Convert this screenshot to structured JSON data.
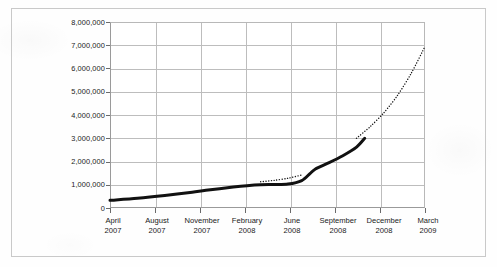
{
  "chart_data": {
    "type": "line",
    "title": "",
    "subtitle": "",
    "xlabel": "",
    "ylabel": "",
    "grid": true,
    "legend": "none",
    "xlim": [
      "April 2007",
      "March 2009"
    ],
    "ylim": [
      0,
      8000000
    ],
    "ytick_labels": [
      "8,000,000",
      "7,000,000",
      "6,000,000",
      "5,000,000",
      "4,000,000",
      "3,000,000",
      "2,000,000",
      "1,000,000",
      "0"
    ],
    "ytick_values": [
      8000000,
      7000000,
      6000000,
      5000000,
      4000000,
      3000000,
      2000000,
      1000000,
      0
    ],
    "categories": [
      {
        "month": "April",
        "year": "2007"
      },
      {
        "month": "August",
        "year": "2007"
      },
      {
        "month": "November",
        "year": "2007"
      },
      {
        "month": "February",
        "year": "2008"
      },
      {
        "month": "June",
        "year": "2008"
      },
      {
        "month": "September",
        "year": "2008"
      },
      {
        "month": "December",
        "year": "2008"
      },
      {
        "month": "March",
        "year": "2009"
      }
    ],
    "series": [
      {
        "name": "actual",
        "style": "solid",
        "color": "#111111",
        "width": 3,
        "points": [
          {
            "x": "April 2007",
            "y": 330000
          },
          {
            "x": "June 2007",
            "y": 420000
          },
          {
            "x": "August 2007",
            "y": 540000
          },
          {
            "x": "October 2007",
            "y": 680000
          },
          {
            "x": "November 2007",
            "y": 760000
          },
          {
            "x": "January 2008",
            "y": 900000
          },
          {
            "x": "February 2008",
            "y": 960000
          },
          {
            "x": "March 2008",
            "y": 1000000
          },
          {
            "x": "April 2008",
            "y": 1010000
          },
          {
            "x": "May 2008",
            "y": 1030000
          },
          {
            "x": "June 2008",
            "y": 1180000
          },
          {
            "x": "June 2008 (late)",
            "y": 1480000
          },
          {
            "x": "July 2008",
            "y": 1680000
          },
          {
            "x": "August 2008",
            "y": 1950000
          },
          {
            "x": "September 2008",
            "y": 2250000
          },
          {
            "x": "October 2008",
            "y": 2620000
          },
          {
            "x": "October 2008 (late)",
            "y": 3000000
          }
        ]
      },
      {
        "name": "projection-gap",
        "style": "dotted",
        "color": "#1a1a1a",
        "width": 1.4,
        "points": [
          {
            "x": "March 2008",
            "y": 1130000
          },
          {
            "x": "April 2008",
            "y": 1190000
          },
          {
            "x": "May 2008",
            "y": 1280000
          },
          {
            "x": "June 2008",
            "y": 1420000
          }
        ]
      },
      {
        "name": "forecast",
        "style": "dotted",
        "color": "#1a1a1a",
        "width": 1.4,
        "points": [
          {
            "x": "October 2008",
            "y": 3000000
          },
          {
            "x": "November 2008",
            "y": 3500000
          },
          {
            "x": "December 2008",
            "y": 4100000
          },
          {
            "x": "January 2009",
            "y": 4850000
          },
          {
            "x": "February 2009",
            "y": 5800000
          },
          {
            "x": "March 2009",
            "y": 6950000
          }
        ]
      }
    ]
  }
}
